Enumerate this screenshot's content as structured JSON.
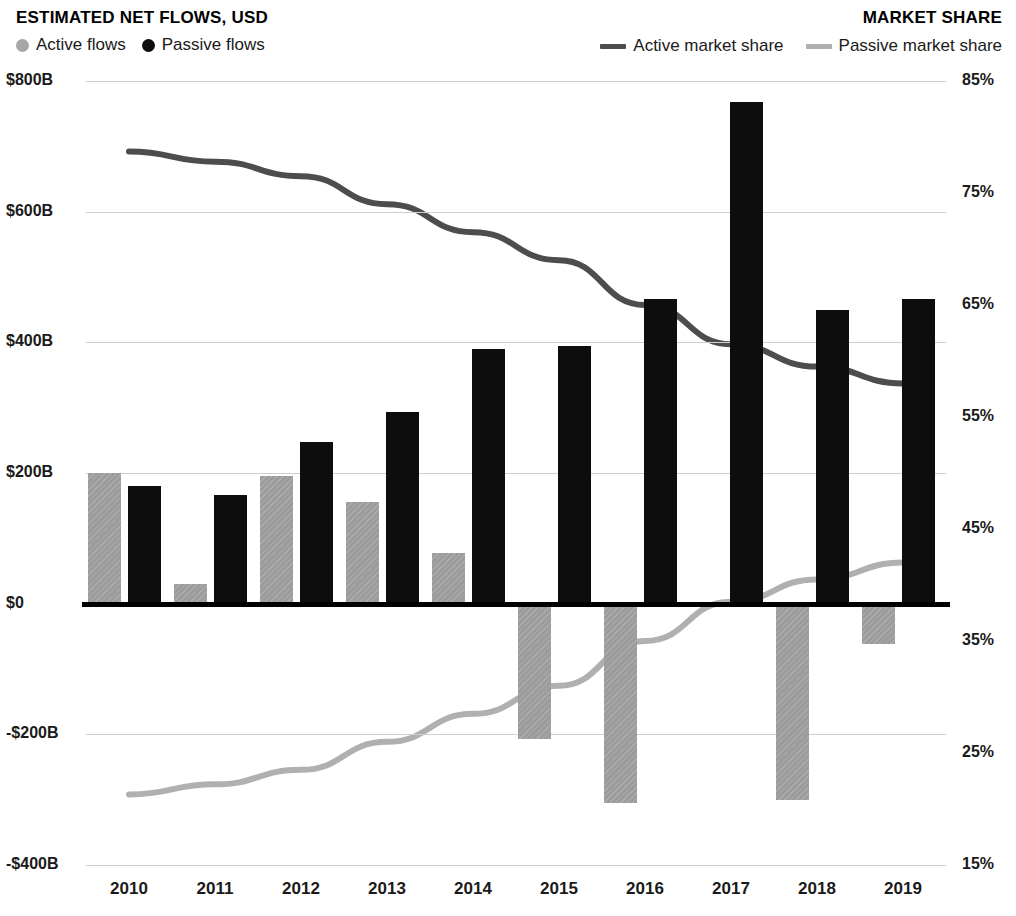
{
  "header": {
    "left_title": "ESTIMATED NET FLOWS, USD",
    "right_title": "MARKET SHARE",
    "legend_left": [
      {
        "label": "Active flows",
        "marker": "dot-icon",
        "color": "#a6a6a6"
      },
      {
        "label": "Passive flows",
        "marker": "dot-icon",
        "color": "#0d0d0d"
      }
    ],
    "legend_right": [
      {
        "label": "Active market share",
        "marker": "line-swatch-icon",
        "color": "#4d4d4d"
      },
      {
        "label": "Passive market share",
        "marker": "line-swatch-icon",
        "color": "#b0b0b0"
      }
    ]
  },
  "colors": {
    "active_bar": "#9c9c9c",
    "passive_bar": "#0d0d0d",
    "active_line": "#4d4d4d",
    "passive_line": "#b0b0b0",
    "gridline": "#cfcfcf",
    "zeroline": "#000000"
  },
  "chart_data": {
    "type": "bar",
    "title": "ESTIMATED NET FLOWS, USD",
    "subtitle": "MARKET SHARE",
    "xlabel": "",
    "ylabel": "Estimated net flows, USD",
    "y2label": "Market share",
    "grid": true,
    "legend_position": "top",
    "categories": [
      "2010",
      "2011",
      "2012",
      "2013",
      "2014",
      "2015",
      "2016",
      "2017",
      "2018",
      "2019"
    ],
    "ylim": [
      -400,
      800
    ],
    "yticks": [
      800,
      600,
      400,
      200,
      0,
      -200,
      -400
    ],
    "ytick_labels": [
      "$800B",
      "$600B",
      "$400B",
      "$200B",
      "$0",
      "-$200B",
      "-$400B"
    ],
    "y2lim": [
      15,
      85
    ],
    "y2ticks": [
      85,
      75,
      65,
      55,
      45,
      35,
      25,
      15
    ],
    "y2tick_labels": [
      "85%",
      "75%",
      "65%",
      "55%",
      "45%",
      "35%",
      "25%",
      "15%"
    ],
    "series": [
      {
        "name": "Active flows",
        "kind": "bar",
        "axis": "left",
        "unit": "USD billions",
        "values": [
          200,
          30,
          196,
          155,
          78,
          -207,
          -305,
          0,
          -300,
          -62
        ]
      },
      {
        "name": "Passive flows",
        "kind": "bar",
        "axis": "left",
        "unit": "USD billions",
        "values": [
          180,
          166,
          248,
          293,
          390,
          394,
          467,
          768,
          450,
          466
        ]
      },
      {
        "name": "Active market share",
        "kind": "line",
        "axis": "right",
        "unit": "percent",
        "values": [
          78.7,
          77.8,
          76.5,
          74.0,
          71.5,
          69.0,
          65.0,
          61.5,
          59.5,
          58.0
        ]
      },
      {
        "name": "Passive market share",
        "kind": "line",
        "axis": "right",
        "unit": "percent",
        "values": [
          21.3,
          22.2,
          23.5,
          26.0,
          28.5,
          31.0,
          35.0,
          38.5,
          40.5,
          42.0
        ]
      }
    ]
  }
}
